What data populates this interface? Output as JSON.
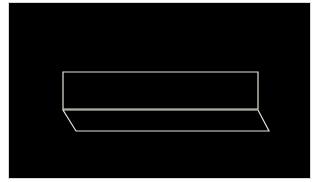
{
  "diagram": {
    "background_color": "#000000",
    "border_color": "#d8d8d8",
    "line_color": "#e6e1d6",
    "shapes": [
      {
        "name": "vertical-plane",
        "type": "rectangle",
        "points": [
          [
            63,
            72
          ],
          [
            258,
            72
          ],
          [
            258,
            109
          ],
          [
            63,
            109
          ]
        ]
      },
      {
        "name": "slanted-plane",
        "type": "parallelogram",
        "points": [
          [
            63,
            110
          ],
          [
            258,
            110
          ],
          [
            269,
            131
          ],
          [
            76,
            131
          ]
        ]
      }
    ]
  }
}
